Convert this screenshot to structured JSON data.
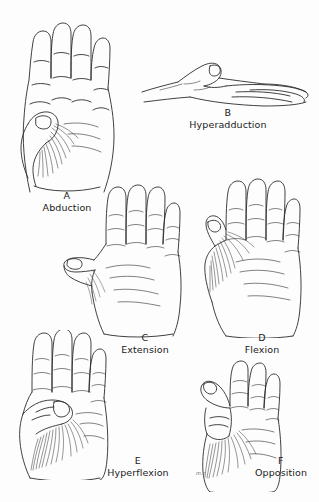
{
  "figure": {
    "background_color": "#fdfdfd",
    "ink_color": "#2b2b2b",
    "signature": "m.c"
  },
  "panels": [
    {
      "letter": "A",
      "name": "Abduction",
      "view": "palmar view of left hand, thumb drawn toward palm base",
      "icon": "hand-palm-icon"
    },
    {
      "letter": "B",
      "name": "Hyperadduction",
      "view": "lateral view of hand lying flat, thumb raised",
      "icon": "hand-lateral-icon"
    },
    {
      "letter": "C",
      "name": "Extension",
      "view": "palmar view, thumb extended laterally away from palm",
      "icon": "hand-palm-icon"
    },
    {
      "letter": "D",
      "name": "Flexion",
      "view": "palmar view, thumb flexed toward index finger",
      "icon": "hand-palm-icon"
    },
    {
      "letter": "E",
      "name": "Hyperflexion",
      "view": "palmar view, thumb fully flexed across the palm",
      "icon": "hand-palm-icon"
    },
    {
      "letter": "F",
      "name": "Opposition",
      "view": "palmar view, thumb tip touching index finger tip",
      "icon": "hand-opposition-icon"
    }
  ]
}
